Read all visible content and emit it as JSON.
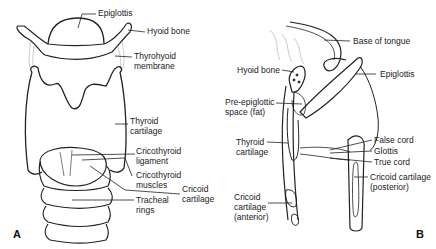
{
  "panels": {
    "a": {
      "letter": "A",
      "labels": {
        "epiglottis": "Epiglottis",
        "hyoid_bone": "Hyoid bone",
        "thyrohyoid_1": "Thyrohyoid",
        "thyrohyoid_2": "membrane",
        "thyroid_1": "Thyroid",
        "thyroid_2": "cartilage",
        "cricothyroid_lig_1": "Cricothyroid",
        "cricothyroid_lig_2": "ligament",
        "cricothyroid_mus_1": "Cricothyroid",
        "cricothyroid_mus_2": "muscles",
        "cricoid_1": "Cricoid",
        "cricoid_2": "cartilage",
        "tracheal_1": "Tracheal",
        "tracheal_2": "rings"
      }
    },
    "b": {
      "letter": "B",
      "labels": {
        "base_of_tongue": "Base of tongue",
        "hyoid_bone": "Hyoid bone",
        "epiglottis": "Epiglottis",
        "pre_epiglottic_1": "Pre-epiglottic",
        "pre_epiglottic_2": "space (fat)",
        "thyroid_1": "Thyroid",
        "thyroid_2": "cartilage",
        "false_cord": "False cord",
        "glottis": "Glottis",
        "true_cord": "True cord",
        "cricoid_post_1": "Cricoid cartilage",
        "cricoid_post_2": "(posterior)",
        "cricoid_ant_1": "Cricoid",
        "cricoid_ant_2": "cartilage",
        "cricoid_ant_3": "(anterior)"
      }
    }
  }
}
